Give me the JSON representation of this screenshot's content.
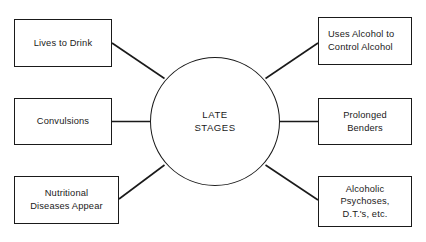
{
  "diagram": {
    "type": "hub-and-spoke",
    "title": "LATE STAGES",
    "center": {
      "label": "LATE\nSTAGES",
      "shape": "circle"
    },
    "colors": {
      "background": "#ffffff",
      "stroke": "#1a1a1a",
      "text": "#1a1a1a"
    },
    "nodes": [
      {
        "id": "lives-to-drink",
        "label": "Lives to Drink",
        "side": "left",
        "position": "top",
        "align": "center"
      },
      {
        "id": "convulsions",
        "label": "Convulsions",
        "side": "left",
        "position": "middle",
        "align": "center"
      },
      {
        "id": "nutritional-diseases-appear",
        "label": "Nutritional\nDiseases Appear",
        "side": "left",
        "position": "bottom",
        "align": "center"
      },
      {
        "id": "uses-alcohol-to-control-alcohol",
        "label": "Uses Alcohol to\nControl Alcohol",
        "side": "right",
        "position": "top",
        "align": "left"
      },
      {
        "id": "prolonged-benders",
        "label": "Prolonged\nBenders",
        "side": "right",
        "position": "middle",
        "align": "center"
      },
      {
        "id": "alcoholic-psychoses",
        "label": "Alcoholic\nPsychoses,\nD.T.'s, etc.",
        "side": "right",
        "position": "bottom",
        "align": "center"
      }
    ],
    "connectors": [
      {
        "from": "lives-to-drink",
        "to": "center",
        "style": "diagonal"
      },
      {
        "from": "convulsions",
        "to": "center",
        "style": "horizontal"
      },
      {
        "from": "nutritional-diseases-appear",
        "to": "center",
        "style": "diagonal"
      },
      {
        "from": "center",
        "to": "uses-alcohol-to-control-alcohol",
        "style": "diagonal"
      },
      {
        "from": "center",
        "to": "prolonged-benders",
        "style": "horizontal"
      },
      {
        "from": "center",
        "to": "alcoholic-psychoses",
        "style": "diagonal"
      }
    ]
  }
}
